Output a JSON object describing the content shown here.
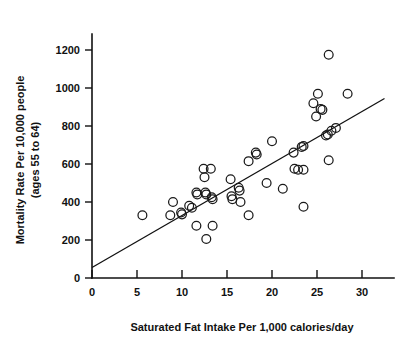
{
  "chart_data": {
    "type": "scatter",
    "title": "",
    "xlabel": "Saturated Fat Intake Per 1,000 calories/day",
    "ylabel_line1": "Mortality Rate Per 10,000 people",
    "ylabel_line2": "(ages 55 to 64)",
    "ylabel": "Mortality Rate Per 10,000 people (ages 55 to 64)",
    "xlim": [
      0,
      31.5
    ],
    "ylim": [
      0,
      1260
    ],
    "xticks": [
      0,
      5,
      10,
      15,
      20,
      25,
      30
    ],
    "xtick_labels": [
      "0",
      "5",
      "10",
      "15",
      "20",
      "25",
      "30"
    ],
    "yticks": [
      0,
      200,
      400,
      600,
      800,
      1000,
      1200
    ],
    "ytick_labels": [
      "0",
      "200",
      "400",
      "600",
      "800",
      "1000",
      "1200"
    ],
    "grid": false,
    "legend": null,
    "marker": "open-circle",
    "marker_color": "#1a1a1a",
    "points": [
      {
        "x": 5.6,
        "y": 330
      },
      {
        "x": 8.7,
        "y": 330
      },
      {
        "x": 9.0,
        "y": 400
      },
      {
        "x": 9.9,
        "y": 345
      },
      {
        "x": 10.0,
        "y": 335
      },
      {
        "x": 10.8,
        "y": 380
      },
      {
        "x": 11.1,
        "y": 370
      },
      {
        "x": 11.6,
        "y": 450
      },
      {
        "x": 11.7,
        "y": 440
      },
      {
        "x": 11.6,
        "y": 275
      },
      {
        "x": 12.4,
        "y": 575
      },
      {
        "x": 12.5,
        "y": 530
      },
      {
        "x": 12.6,
        "y": 450
      },
      {
        "x": 12.7,
        "y": 440
      },
      {
        "x": 12.7,
        "y": 205
      },
      {
        "x": 13.2,
        "y": 575
      },
      {
        "x": 13.3,
        "y": 425
      },
      {
        "x": 13.4,
        "y": 415
      },
      {
        "x": 13.4,
        "y": 275
      },
      {
        "x": 15.4,
        "y": 520
      },
      {
        "x": 15.5,
        "y": 430
      },
      {
        "x": 15.6,
        "y": 415
      },
      {
        "x": 16.3,
        "y": 475
      },
      {
        "x": 16.4,
        "y": 460
      },
      {
        "x": 16.5,
        "y": 400
      },
      {
        "x": 17.4,
        "y": 615
      },
      {
        "x": 17.4,
        "y": 330
      },
      {
        "x": 18.2,
        "y": 660
      },
      {
        "x": 18.3,
        "y": 650
      },
      {
        "x": 19.4,
        "y": 500
      },
      {
        "x": 20.0,
        "y": 720
      },
      {
        "x": 21.2,
        "y": 470
      },
      {
        "x": 22.4,
        "y": 660
      },
      {
        "x": 22.5,
        "y": 575
      },
      {
        "x": 22.9,
        "y": 570
      },
      {
        "x": 23.3,
        "y": 690
      },
      {
        "x": 23.5,
        "y": 695
      },
      {
        "x": 23.5,
        "y": 570
      },
      {
        "x": 23.5,
        "y": 375
      },
      {
        "x": 24.6,
        "y": 920
      },
      {
        "x": 24.9,
        "y": 850
      },
      {
        "x": 25.1,
        "y": 970
      },
      {
        "x": 25.4,
        "y": 890
      },
      {
        "x": 25.6,
        "y": 885
      },
      {
        "x": 26.0,
        "y": 750
      },
      {
        "x": 26.2,
        "y": 755
      },
      {
        "x": 26.3,
        "y": 1175
      },
      {
        "x": 26.3,
        "y": 620
      },
      {
        "x": 26.6,
        "y": 775
      },
      {
        "x": 27.1,
        "y": 790
      },
      {
        "x": 28.4,
        "y": 970
      }
    ],
    "trend_line": {
      "x_start": 0,
      "y_start": 55,
      "x_end": 32.5,
      "y_end": 945
    }
  }
}
